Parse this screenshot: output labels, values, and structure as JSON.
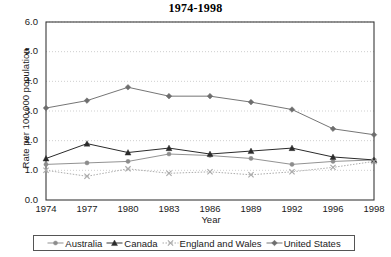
{
  "chart_data": {
    "type": "line",
    "title": "1974-1998",
    "xlabel": "Year",
    "ylabel": "Rate per 100,000 population",
    "categories": [
      "1974",
      "1977",
      "1980",
      "1983",
      "1986",
      "1989",
      "1992",
      "1996",
      "1998"
    ],
    "ylim": [
      0.0,
      6.0
    ],
    "ytick_labels": [
      "0.0",
      "1.0",
      "2.0",
      "3.0",
      "4.0",
      "5.0",
      "6.0"
    ],
    "ytick_values": [
      0.0,
      1.0,
      2.0,
      3.0,
      4.0,
      5.0,
      6.0
    ],
    "grid": "horizontal-dotted",
    "legend_position": "bottom",
    "series": [
      {
        "name": "Australia",
        "marker": "small-dash-dot",
        "color": "#8c8c8c",
        "values": [
          1.2,
          1.25,
          1.3,
          1.55,
          1.5,
          1.4,
          1.2,
          1.3,
          1.35
        ]
      },
      {
        "name": "Canada",
        "marker": "filled-triangle",
        "color": "#2b2b2b",
        "values": [
          1.4,
          1.9,
          1.6,
          1.75,
          1.55,
          1.65,
          1.75,
          1.45,
          1.35
        ]
      },
      {
        "name": "England and Wales",
        "marker": "x-cross",
        "color": "#a8a8a8",
        "values": [
          1.0,
          0.8,
          1.05,
          0.9,
          0.95,
          0.85,
          0.95,
          1.1,
          1.3
        ]
      },
      {
        "name": "United States",
        "marker": "filled-diamond",
        "color": "#6e6e6e",
        "values": [
          3.1,
          3.35,
          3.8,
          3.5,
          3.5,
          3.3,
          3.05,
          2.4,
          2.2
        ]
      }
    ]
  },
  "legend": {
    "items": [
      {
        "label": "Australia"
      },
      {
        "label": "Canada"
      },
      {
        "label": "England and Wales"
      },
      {
        "label": "United States"
      }
    ]
  }
}
